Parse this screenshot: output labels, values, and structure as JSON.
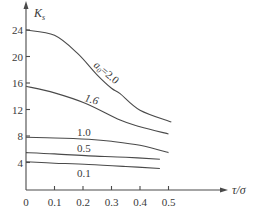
{
  "chart_data": {
    "type": "line",
    "title": "",
    "xlabel": "τ/σ",
    "ylabel": "K",
    "ylabel_sub": "s",
    "xlim": [
      0,
      0.5
    ],
    "ylim": [
      0,
      24
    ],
    "grid": false,
    "legend": "inline curve labels",
    "x_ticks": [
      0,
      0.1,
      0.2,
      0.3,
      0.4,
      0.5
    ],
    "x_tick_labels": [
      "0",
      "0.1",
      "0.2",
      "0.3",
      "0.4",
      "0.5"
    ],
    "y_ticks": [
      4,
      8,
      12,
      16,
      20,
      24
    ],
    "y_tick_labels": [
      "4",
      "8",
      "12",
      "16",
      "20",
      "24"
    ],
    "series": [
      {
        "name": "a0=2.0",
        "label_prefix": "a",
        "label_sub": "0",
        "label_suffix": "=2.0",
        "x": [
          0,
          0.1,
          0.18,
          0.25,
          0.3,
          0.33,
          0.4,
          0.51
        ],
        "values": [
          24.0,
          23.2,
          20.5,
          17.2,
          15.2,
          14.4,
          11.9,
          10.1
        ]
      },
      {
        "name": "1.6",
        "label": "1.6",
        "x": [
          0,
          0.1,
          0.21,
          0.33,
          0.4,
          0.5
        ],
        "values": [
          15.5,
          14.5,
          12.9,
          10.4,
          9.4,
          8.3
        ]
      },
      {
        "name": "1.0",
        "label": "1.0",
        "x": [
          0,
          0.1,
          0.22,
          0.3,
          0.4,
          0.5
        ],
        "values": [
          7.8,
          7.7,
          7.5,
          7.2,
          6.6,
          5.5
        ]
      },
      {
        "name": "0.5",
        "label": "0.5",
        "x": [
          0,
          0.1,
          0.22,
          0.35,
          0.47
        ],
        "values": [
          5.5,
          5.3,
          5.0,
          4.8,
          4.5
        ]
      },
      {
        "name": "0.1",
        "label": "0.1",
        "x": [
          0,
          0.1,
          0.22,
          0.35,
          0.47
        ],
        "values": [
          4.1,
          3.9,
          3.7,
          3.4,
          3.1
        ]
      }
    ]
  }
}
